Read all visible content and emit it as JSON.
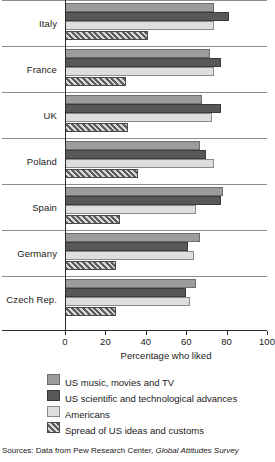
{
  "chart_data": {
    "type": "bar",
    "orientation": "horizontal",
    "title": "",
    "xlabel": "Percentage who liked",
    "ylabel": "",
    "xlim": [
      0,
      100
    ],
    "xticks": [
      0,
      20,
      40,
      60,
      80,
      100
    ],
    "grid": false,
    "legend_position": "bottom",
    "categories": [
      "Italy",
      "France",
      "UK",
      "Poland",
      "Spain",
      "Germany",
      "Czech Rep."
    ],
    "series": [
      {
        "name": "US music, movies and TV",
        "color": "#9c9c9c",
        "values": [
          74,
          72,
          68,
          67,
          78,
          67,
          65
        ]
      },
      {
        "name": "US scientific and technological advances",
        "color": "#585858",
        "values": [
          81,
          77,
          77,
          70,
          77,
          61,
          60
        ]
      },
      {
        "name": "Americans",
        "color": "#dedede",
        "values": [
          74,
          74,
          73,
          74,
          65,
          64,
          62
        ]
      },
      {
        "name": "Spread of US ideas and customs",
        "color": "hatched",
        "values": [
          41,
          30,
          31,
          36,
          27,
          25,
          25
        ]
      }
    ],
    "source": "Sources: Data from Pew Research Center, Global Attitudes Survey",
    "source_prefix": "Sources: Data from Pew Research Center,",
    "source_italic": "Global Attitudes Survey"
  }
}
